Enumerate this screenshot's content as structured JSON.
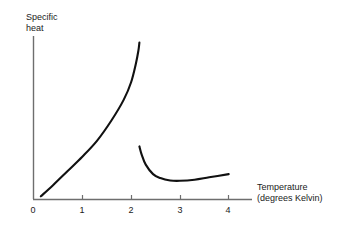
{
  "chart_data": {
    "type": "line",
    "title": "",
    "subtitle": "",
    "xlabel": "Temperature (degrees Kelvin)",
    "ylabel": "Specific heat",
    "xlabel_line1": "Temperature",
    "xlabel_line2": "(degrees Kelvin)",
    "ylabel_line1": "Specific",
    "ylabel_line2": "heat",
    "xlim": [
      0,
      4.4
    ],
    "ylim": [
      0,
      1
    ],
    "xticks": [
      0,
      1,
      2,
      3,
      4
    ],
    "xtick_labels": [
      "0",
      "1",
      "2",
      "3",
      "4"
    ],
    "yticks": [],
    "ytick_labels": [],
    "grid": false,
    "legend": null,
    "axis_color": "#6e6e6e",
    "curve_color": "#111111",
    "annotations": [],
    "series": [
      {
        "name": "lambda-branch-below-transition",
        "comment": "Specific heat rising steeply toward the lambda point near 2.17 K",
        "x": [
          0.15,
          0.4,
          0.7,
          1.0,
          1.3,
          1.6,
          1.85,
          2.0,
          2.1,
          2.15,
          2.17
        ],
        "y": [
          0.02,
          0.09,
          0.18,
          0.27,
          0.37,
          0.5,
          0.63,
          0.74,
          0.86,
          0.94,
          0.99
        ]
      },
      {
        "name": "branch-above-transition",
        "comment": "Specific heat above the lambda point, dipping to a shallow minimum near 3 K then rising slightly",
        "x": [
          2.17,
          2.22,
          2.3,
          2.45,
          2.6,
          2.8,
          3.0,
          3.3,
          3.6,
          4.0
        ],
        "y": [
          0.335,
          0.28,
          0.22,
          0.16,
          0.135,
          0.12,
          0.118,
          0.125,
          0.14,
          0.16
        ]
      }
    ]
  },
  "ticks": [
    {
      "label": "0"
    },
    {
      "label": "1"
    },
    {
      "label": "2"
    },
    {
      "label": "3"
    },
    {
      "label": "4"
    }
  ]
}
